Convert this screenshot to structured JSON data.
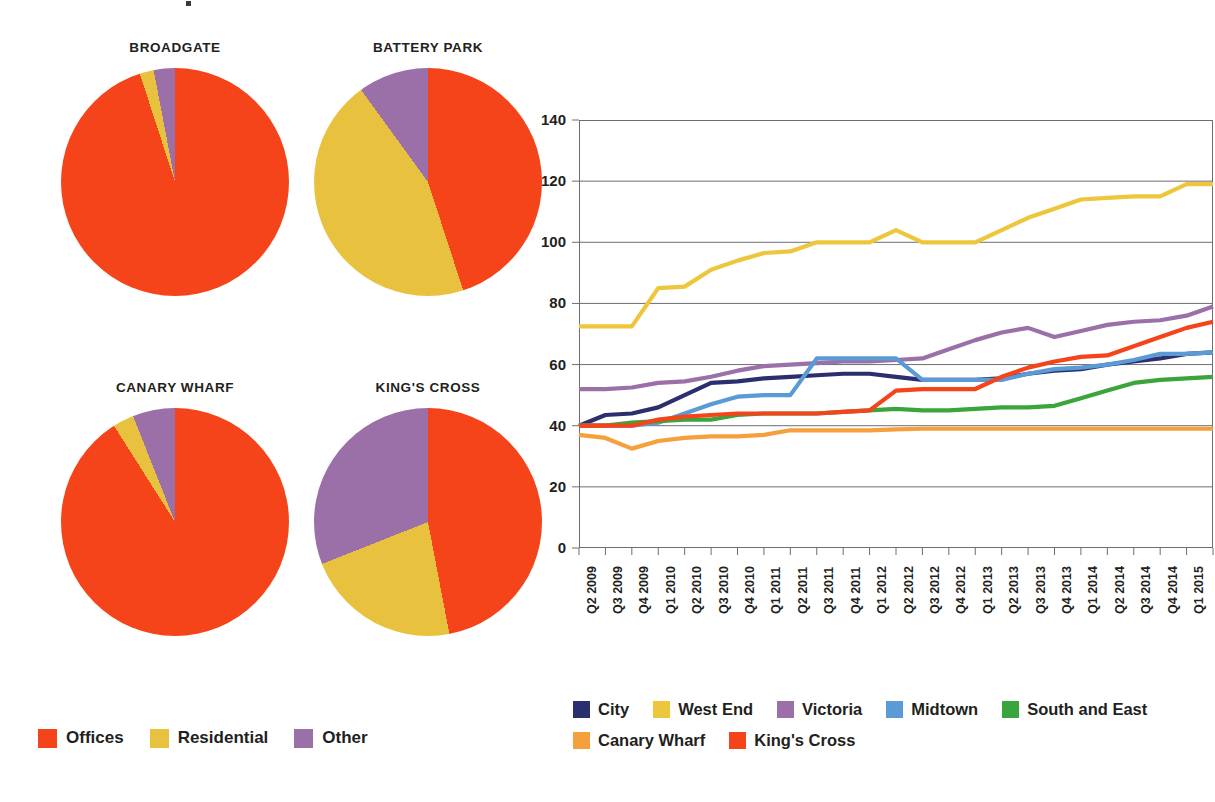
{
  "chart_data": [
    {
      "type": "pie",
      "title": "BROADGATE",
      "labels": [
        "Offices",
        "Residential",
        "Other"
      ],
      "values": [
        95,
        2,
        3
      ],
      "colors": [
        "#f5431a",
        "#e8c13f",
        "#9b6fa8"
      ]
    },
    {
      "type": "pie",
      "title": "BATTERY PARK",
      "labels": [
        "Offices",
        "Residential",
        "Other"
      ],
      "values": [
        45,
        45,
        10
      ],
      "colors": [
        "#f5431a",
        "#e8c13f",
        "#9b6fa8"
      ]
    },
    {
      "type": "pie",
      "title": "CANARY WHARF",
      "labels": [
        "Offices",
        "Residential",
        "Other"
      ],
      "values": [
        91,
        3,
        6
      ],
      "colors": [
        "#f5431a",
        "#e8c13f",
        "#9b6fa8"
      ]
    },
    {
      "type": "pie",
      "title": "KING'S CROSS",
      "labels": [
        "Offices",
        "Residential",
        "Other"
      ],
      "values": [
        47,
        22,
        31
      ],
      "colors": [
        "#f5431a",
        "#e8c13f",
        "#9b6fa8"
      ]
    },
    {
      "type": "line",
      "title": "",
      "xlabel": "",
      "ylabel": "",
      "ylim": [
        0,
        140
      ],
      "yticks": [
        0,
        20,
        40,
        60,
        80,
        100,
        120,
        140
      ],
      "grid": true,
      "legend_position": "bottom",
      "categories": [
        "Q2 2009",
        "Q3 2009",
        "Q4 2009",
        "Q1 2010",
        "Q2 2010",
        "Q3 2010",
        "Q4 2010",
        "Q1 2011",
        "Q2 2011",
        "Q3 2011",
        "Q4 2011",
        "Q1 2012",
        "Q2 2012",
        "Q3 2012",
        "Q4 2012",
        "Q1 2013",
        "Q2 2013",
        "Q3 2013",
        "Q4 2013",
        "Q1 2014",
        "Q2 2014",
        "Q3 2014",
        "Q4 2014",
        "Q1 2015",
        "Q2 2015"
      ],
      "series": [
        {
          "name": "City",
          "color": "#2b2f6e",
          "values": [
            40,
            43.5,
            44,
            46,
            50,
            54,
            54.5,
            55.5,
            56,
            56.5,
            57,
            57,
            56,
            55,
            55,
            55,
            55.5,
            57,
            58,
            58.5,
            60,
            61,
            62,
            63.5,
            64
          ]
        },
        {
          "name": "West End",
          "color": "#edc63c",
          "values": [
            72.5,
            72.5,
            72.5,
            85,
            85.5,
            91,
            94,
            96.5,
            97,
            100,
            100,
            100,
            104,
            100,
            100,
            100,
            104,
            108,
            111,
            114,
            114.5,
            115,
            115,
            119,
            119
          ]
        },
        {
          "name": "Victoria",
          "color": "#9b6fa8",
          "values": [
            52,
            52,
            52.5,
            54,
            54.5,
            56,
            58,
            59.5,
            60,
            60.5,
            61,
            61,
            61.5,
            62,
            65,
            68,
            70.5,
            72,
            69,
            71,
            73,
            74,
            74.5,
            76,
            79
          ]
        },
        {
          "name": "Midtown",
          "color": "#5b9bd5",
          "values": [
            40,
            40,
            40,
            41,
            44,
            47,
            49.5,
            50,
            50,
            62,
            62,
            62,
            62,
            55,
            55,
            55,
            55,
            57,
            58.5,
            59,
            60,
            61.5,
            63.5,
            63.5,
            64
          ]
        },
        {
          "name": "South and East",
          "color": "#3aa53a",
          "values": [
            40,
            40,
            41,
            41.5,
            42,
            42,
            43.5,
            44,
            44,
            44,
            44.5,
            45,
            45.5,
            45,
            45,
            45.5,
            46,
            46,
            46.5,
            49,
            51.5,
            54,
            55,
            55.5,
            56
          ]
        },
        {
          "name": "Canary Wharf",
          "color": "#f5a03c",
          "values": [
            37,
            36,
            32.5,
            35,
            36,
            36.5,
            36.5,
            37,
            38.5,
            38.5,
            38.5,
            38.5,
            38.8,
            39,
            39,
            39,
            39,
            39,
            39,
            39,
            39,
            39,
            39,
            39,
            39
          ]
        },
        {
          "name": "King's Cross",
          "color": "#f5431a",
          "values": [
            40,
            40,
            40,
            42,
            43,
            43.5,
            44,
            44,
            44,
            44,
            44.5,
            45,
            51.5,
            52,
            52,
            52,
            56,
            59,
            61,
            62.5,
            63,
            66,
            69,
            72,
            74
          ]
        }
      ]
    }
  ],
  "pies": {
    "legend": [
      {
        "label": "Offices",
        "color": "#f5431a"
      },
      {
        "label": "Residential",
        "color": "#e8c13f"
      },
      {
        "label": "Other",
        "color": "#9b6fa8"
      }
    ]
  },
  "line_legend": {
    "row1": [
      {
        "label": "City",
        "color": "#2b2f6e"
      },
      {
        "label": "West End",
        "color": "#edc63c"
      },
      {
        "label": "Victoria",
        "color": "#9b6fa8"
      },
      {
        "label": "Midtown",
        "color": "#5b9bd5"
      },
      {
        "label": "South and East",
        "color": "#3aa53a"
      }
    ],
    "row2": [
      {
        "label": "Canary Wharf",
        "color": "#f5a03c"
      },
      {
        "label": "King's Cross",
        "color": "#f5431a"
      }
    ]
  }
}
